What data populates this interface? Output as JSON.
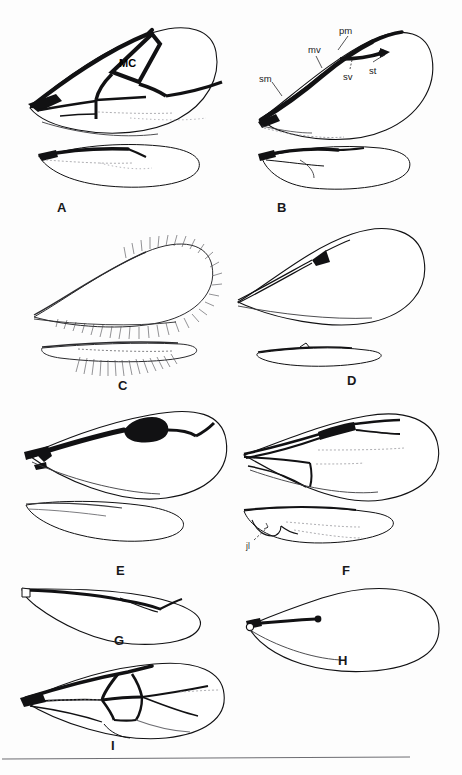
{
  "plate": {
    "background_color": "#fdfdfd",
    "ink_color": "#111113",
    "faint_ink_color": "#8d8d92",
    "width": 462,
    "height": 775,
    "bottom_rule": true
  },
  "panels": [
    {
      "letter": "A",
      "letter_x": 57,
      "letter_y": 200,
      "description": "forewing with heavy submarginal and marginal veins enclosing a marginal cell, plus hind wing below"
    },
    {
      "letter": "B",
      "letter_x": 277,
      "letter_y": 200,
      "description": "forewing with labelled submarginal, marginal, postmarginal and stigmal veins and stigma, plus hind wing below"
    },
    {
      "letter": "C",
      "letter_x": 118,
      "letter_y": 378,
      "description": "narrow fore wing with long marginal fringe setae and fringed hind wing below"
    },
    {
      "letter": "D",
      "letter_x": 347,
      "letter_y": 373,
      "description": "fore wing with slender venation and small triangular stigma, plus narrow hind wing below"
    },
    {
      "letter": "E",
      "letter_x": 116,
      "letter_y": 563,
      "description": "fore wing with greatly enlarged dark stigma and hind wing below"
    },
    {
      "letter": "F",
      "letter_x": 342,
      "letter_y": 563,
      "description": "fore wing with elongate venation and dark stigma, hind wing below with jugal lobe labelled"
    },
    {
      "letter": "G",
      "letter_x": 114,
      "letter_y": 633,
      "description": "stalked paddle-shaped wing with reduced venation"
    },
    {
      "letter": "H",
      "letter_x": 338,
      "letter_y": 653,
      "description": "broad petiolate wing with very short venation ending in a knob"
    },
    {
      "letter": "I",
      "letter_x": 111,
      "letter_y": 738,
      "description": "fully veined wing with several closed cells"
    }
  ],
  "labels": {
    "marginal_cell": {
      "text": "MC",
      "x": 119,
      "y": 57,
      "panel": "A"
    },
    "vein_labels": [
      {
        "text": "sm",
        "x": 259,
        "y": 73,
        "panel": "B",
        "name": "submarginal-vein-label"
      },
      {
        "text": "mv",
        "x": 308,
        "y": 44,
        "panel": "B",
        "name": "marginal-vein-label"
      },
      {
        "text": "pm",
        "x": 339,
        "y": 25,
        "panel": "B",
        "name": "postmarginal-vein-label"
      },
      {
        "text": "sv",
        "x": 343,
        "y": 71,
        "panel": "B",
        "name": "stigmal-vein-label"
      },
      {
        "text": "st",
        "x": 369,
        "y": 65,
        "panel": "B",
        "name": "stigma-label"
      }
    ],
    "jugal_lobe": {
      "text": "jl",
      "x": 246,
      "y": 541,
      "panel": "F"
    }
  }
}
